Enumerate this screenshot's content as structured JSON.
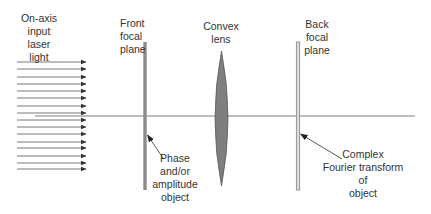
{
  "diagram": {
    "colors": {
      "background": "#ffffff",
      "text": "#333333",
      "rays": "#555555",
      "optical_axis": "#a8a8a8",
      "front_plane": "#8c8c8c",
      "back_plane_fill": "#d9d9d9",
      "back_plane_stroke": "#8c8c8c",
      "lens_fill": "#7f7f7f",
      "lens_stroke": "#5a5a5a",
      "pointer": "#444444"
    },
    "labels": {
      "input": [
        "On-axis",
        "input",
        "laser",
        "light"
      ],
      "front_plane": [
        "Front",
        "focal",
        "plane"
      ],
      "lens": [
        "Convex",
        "lens"
      ],
      "back_plane": [
        "Back",
        "focal",
        "plane"
      ],
      "object": [
        "Phase",
        "and/or",
        "amplitude",
        "object"
      ],
      "fourier": [
        "Complex",
        "Fourier transform",
        "of",
        "object"
      ]
    },
    "rays": {
      "count": 16,
      "x_start": 17,
      "x_end": 86,
      "y_positions": [
        62,
        69,
        77,
        84,
        91,
        98,
        106,
        113,
        120,
        127,
        134,
        142,
        148,
        156,
        163,
        169
      ]
    },
    "optical_axis": {
      "x_start": 35,
      "x_end": 415,
      "y": 116
    },
    "elements": {
      "front_focal_plane": {
        "x": 145,
        "y_top": 42,
        "y_bottom": 190
      },
      "convex_lens": {
        "cx": 221.5,
        "y_top": 51,
        "y_bottom": 186,
        "half_width": 6.5
      },
      "back_focal_plane": {
        "x": 298,
        "y_top": 42,
        "y_bottom": 190
      }
    }
  }
}
